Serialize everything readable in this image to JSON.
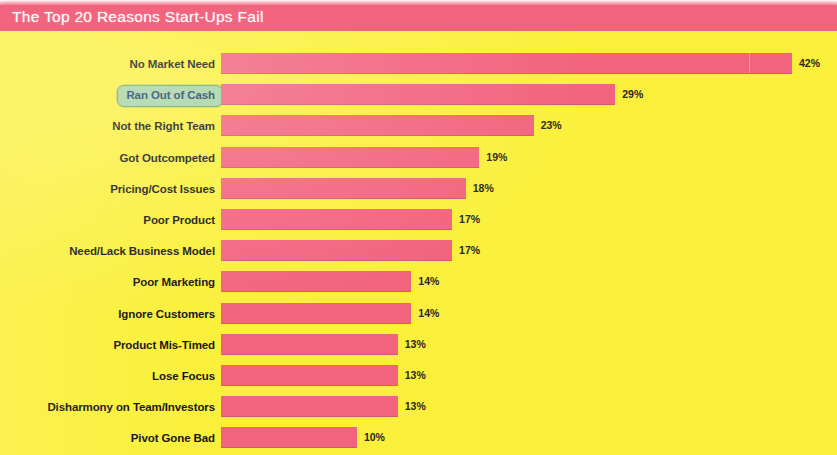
{
  "chart_title": "The Top 20 Reasons Start-Ups Fail",
  "colors": {
    "banner": "#f2647e",
    "bar": "#f2647e",
    "background": "#faf03c",
    "label_text": "#171514",
    "highlight_fill": "#a4d3a2",
    "highlight_border": "#6fa86d",
    "highlight_text": "#1d3a63",
    "title_text": "#fdfdfd"
  },
  "highlighted_category": "Ran Out of Cash",
  "chart_data": {
    "type": "bar",
    "orientation": "horizontal",
    "title": "The Top 20 Reasons Start-Ups Fail",
    "xlabel": "",
    "ylabel": "",
    "xlim": [
      0,
      42
    ],
    "grid": false,
    "legend": false,
    "value_suffix": "%",
    "categories": [
      "No Market Need",
      "Ran Out of Cash",
      "Not the Right Team",
      "Got Outcompeted",
      "Pricing/Cost Issues",
      "Poor Product",
      "Need/Lack Business Model",
      "Poor Marketing",
      "Ignore Customers",
      "Product Mis-Timed",
      "Lose Focus",
      "Disharmony on Team/Investors",
      "Pivot Gone Bad"
    ],
    "values": [
      42,
      29,
      23,
      19,
      18,
      17,
      17,
      14,
      14,
      13,
      13,
      13,
      10
    ],
    "value_labels": [
      "42%",
      "29%",
      "23%",
      "19%",
      "18%",
      "17%",
      "17%",
      "14%",
      "14%",
      "13%",
      "13%",
      "13%",
      "10%"
    ]
  }
}
